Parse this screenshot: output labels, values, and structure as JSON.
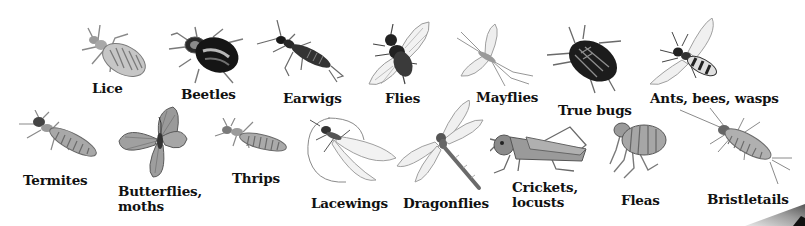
{
  "figure": {
    "background": "#ffffff",
    "label_color": "#111111"
  },
  "insects": [
    {
      "id": "lice",
      "label": "Lice",
      "row": 1
    },
    {
      "id": "beetles",
      "label": "Beetles",
      "row": 1
    },
    {
      "id": "earwigs",
      "label": "Earwigs",
      "row": 1
    },
    {
      "id": "flies",
      "label": "Flies",
      "row": 1
    },
    {
      "id": "mayflies",
      "label": "Mayflies",
      "row": 1
    },
    {
      "id": "true-bugs",
      "label": "True bugs",
      "row": 1
    },
    {
      "id": "ants-bees-wasps",
      "label": "Ants, bees, wasps",
      "row": 1
    },
    {
      "id": "termites",
      "label": "Termites",
      "row": 2
    },
    {
      "id": "butterflies-moths",
      "label": "Butterflies,\nmoths",
      "row": 2
    },
    {
      "id": "thrips",
      "label": "Thrips",
      "row": 2
    },
    {
      "id": "lacewings",
      "label": "Lacewings",
      "row": 2
    },
    {
      "id": "dragonflies",
      "label": "Dragonflies",
      "row": 2
    },
    {
      "id": "crickets-locusts",
      "label": "Crickets,\nlocusts",
      "row": 2
    },
    {
      "id": "fleas",
      "label": "Fleas",
      "row": 2
    },
    {
      "id": "bristletails",
      "label": "Bristletails",
      "row": 2
    }
  ]
}
